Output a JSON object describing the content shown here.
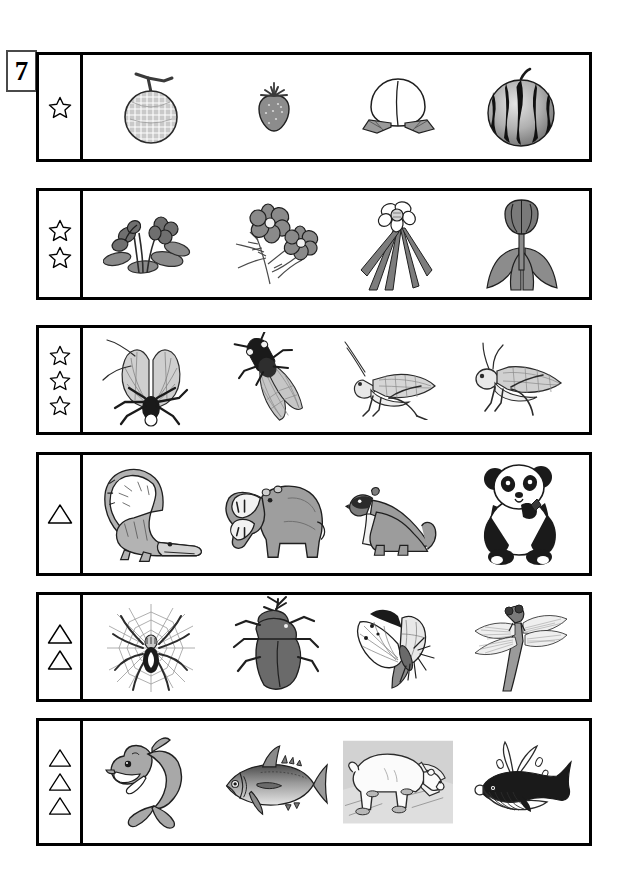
{
  "worksheet": {
    "problem_number": "7",
    "marker_glyphs": {
      "star": "star-outline",
      "triangle": "triangle-outline"
    },
    "rows": [
      {
        "id": "row-1",
        "marker_type": "star",
        "marker_count": 1,
        "category": "fruits",
        "items": [
          {
            "name": "melon",
            "icon": "melon-icon"
          },
          {
            "name": "strawberry",
            "icon": "strawberry-icon"
          },
          {
            "name": "peach",
            "icon": "peach-icon"
          },
          {
            "name": "watermelon",
            "icon": "watermelon-icon"
          }
        ]
      },
      {
        "id": "row-2",
        "marker_type": "star",
        "marker_count": 2,
        "category": "flowers",
        "items": [
          {
            "name": "violet",
            "icon": "violet-flower-icon"
          },
          {
            "name": "cosmos",
            "icon": "cosmos-flower-icon"
          },
          {
            "name": "narcissus",
            "icon": "narcissus-flower-icon"
          },
          {
            "name": "tulip",
            "icon": "tulip-flower-icon"
          }
        ]
      },
      {
        "id": "row-3",
        "marker_type": "star",
        "marker_count": 3,
        "category": "insects-cicada-grasshopper",
        "items": [
          {
            "name": "lantern-fly",
            "icon": "lantern-fly-icon"
          },
          {
            "name": "cicada",
            "icon": "cicada-icon"
          },
          {
            "name": "katydid",
            "icon": "katydid-icon"
          },
          {
            "name": "grasshopper",
            "icon": "grasshopper-icon"
          }
        ]
      },
      {
        "id": "row-4",
        "marker_type": "triangle",
        "marker_count": 1,
        "category": "mammals-and-reptile",
        "items": [
          {
            "name": "crocodile",
            "icon": "crocodile-icon"
          },
          {
            "name": "hippopotamus",
            "icon": "hippopotamus-icon"
          },
          {
            "name": "weasel",
            "icon": "weasel-icon"
          },
          {
            "name": "panda",
            "icon": "panda-icon"
          }
        ]
      },
      {
        "id": "row-5",
        "marker_type": "triangle",
        "marker_count": 2,
        "category": "arthropods",
        "items": [
          {
            "name": "spider-on-web",
            "icon": "spider-web-icon"
          },
          {
            "name": "rhinoceros-beetle",
            "icon": "rhinoceros-beetle-icon"
          },
          {
            "name": "butterfly",
            "icon": "butterfly-icon"
          },
          {
            "name": "dragonfly",
            "icon": "dragonfly-icon"
          }
        ]
      },
      {
        "id": "row-6",
        "marker_type": "triangle",
        "marker_count": 3,
        "category": "aquatic-and-polar-animals",
        "items": [
          {
            "name": "dolphin",
            "icon": "dolphin-icon"
          },
          {
            "name": "tuna",
            "icon": "tuna-icon"
          },
          {
            "name": "polar-bear",
            "icon": "polar-bear-icon"
          },
          {
            "name": "whale",
            "icon": "whale-icon"
          }
        ]
      }
    ]
  },
  "colors": {
    "ink": "#000000",
    "box_border": "#4a4a4a",
    "fill_light": "#d8d8d8",
    "fill_mid": "#a8a8a8",
    "fill_dark": "#6e6e6e",
    "paper": "#ffffff"
  }
}
